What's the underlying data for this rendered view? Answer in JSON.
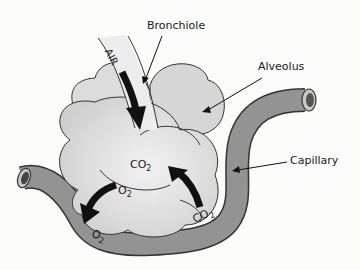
{
  "diagram": {
    "labels": {
      "bronchiole": "Bronchiole",
      "alveolus": "Alveolus",
      "capillary": "Capillary",
      "air": "AIR"
    },
    "gases": {
      "co2_alveolus": "CO",
      "co2_alveolus_sub": "2",
      "o2_alveolus": "O",
      "o2_alveolus_sub": "2",
      "o2_capillary": "O",
      "o2_capillary_sub": "2",
      "co2_capillary": "CO",
      "co2_capillary_sub": "2"
    },
    "arrows": [
      {
        "name": "air-flow",
        "from": "bronchiole",
        "to": "alveolus"
      },
      {
        "name": "o2-diffusion",
        "from": "alveolus",
        "to": "capillary"
      },
      {
        "name": "co2-diffusion",
        "from": "capillary",
        "to": "alveolus"
      }
    ],
    "colors": {
      "background": "#fbfbfa",
      "alveolus_fill": "#dcdcdc",
      "capillary_fill": "#8f8f8f",
      "bronchiole_fill": "#ececec",
      "arrow": "#111111",
      "outline": "#333333"
    }
  }
}
